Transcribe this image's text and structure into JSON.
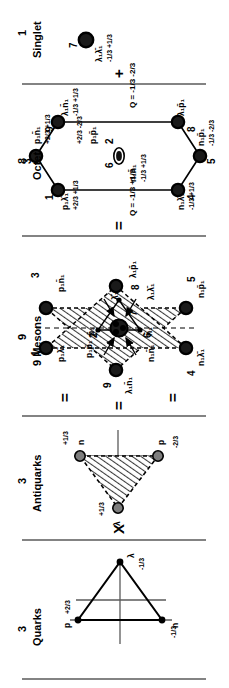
{
  "figure": {
    "ink": "#000000",
    "rule": "#5a5a5a",
    "hatch": "#3a3a3a"
  },
  "headers": [
    {
      "num": "3",
      "name": "Quarks"
    },
    {
      "num": "3",
      "name": "Antiquarks"
    },
    {
      "num": "9",
      "name": "9 Mesons"
    },
    {
      "num": "8",
      "name": "Octet"
    },
    {
      "num": "1",
      "name": "Singlet"
    }
  ],
  "operators": {
    "times": "X",
    "equals": "=",
    "plus": "+"
  },
  "quarks": {
    "nodes": [
      {
        "name": "p",
        "sub": "1",
        "bar": false,
        "charge": "+2/3"
      },
      {
        "name": "λ",
        "sub": "1",
        "bar": false,
        "charge": "-1/3"
      },
      {
        "name": "n",
        "sub": "1",
        "bar": false,
        "charge": "-1/3"
      }
    ]
  },
  "antiquarks": {
    "nodes": [
      {
        "name": "n",
        "sub": "1",
        "bar": true,
        "charge": "+1/3"
      },
      {
        "name": "λ",
        "sub": "1",
        "bar": true,
        "charge": "+1/3"
      },
      {
        "name": "p",
        "sub": "1",
        "bar": true,
        "charge": "-2/3"
      }
    ]
  },
  "mesons": {
    "outer": [
      {
        "index": "1",
        "label": "p₁λ̄₁"
      },
      {
        "index": "4",
        "label": "n₁λ̄₁"
      },
      {
        "index": "5",
        "label": "n₁p̄₁"
      },
      {
        "index": "3",
        "label": "p₁n̄₁"
      },
      {
        "index": "8",
        "label": "λ₁p̄₁"
      },
      {
        "index": "9",
        "label": "λ₁n̄₁"
      }
    ],
    "center": [
      {
        "index": "2",
        "label": "p₁p̄₁"
      },
      {
        "index": "6",
        "label": "n₁n̄₁"
      },
      {
        "index": "7",
        "label": "λ₁λ̄₁"
      }
    ],
    "inner_triangle": [
      {
        "label": "p̄₁"
      },
      {
        "label": "n̄₁"
      },
      {
        "label": "λ̄₁"
      }
    ]
  },
  "octet": {
    "nodes": [
      {
        "index": "1",
        "label": "p₁λ̄₁",
        "charge": "+2/3 +1/3"
      },
      {
        "index": "3",
        "label": "p₁n̄₁",
        "charge": "+2/3 +1/3"
      },
      {
        "index": "9",
        "label": "λ₁n̄₁",
        "charge": "-1/3 +1/3"
      },
      {
        "index": "8",
        "label": "λ₁p̄₁",
        "charge": "-1/3 -2/3"
      },
      {
        "index": "5",
        "label": "n₁p̄₁",
        "charge": "-1/3 -2/3"
      },
      {
        "index": "4",
        "label": "n₁λ̄₁",
        "charge": "-1/3 +1/3"
      }
    ],
    "center": [
      {
        "index": "6",
        "label": "n₁n̄₁",
        "charge": "-1/3 +1/3"
      },
      {
        "index": "2",
        "label": "p₁p̄₁",
        "charge": "+2/3 -2/3"
      }
    ],
    "q_left": "Q = -1/3 +1/3",
    "q_right": "Q = -1/3 -2/3"
  },
  "singlet": {
    "index": "7",
    "label": "λ₁λ̄₁",
    "charge": "-1/3 +1/3"
  }
}
